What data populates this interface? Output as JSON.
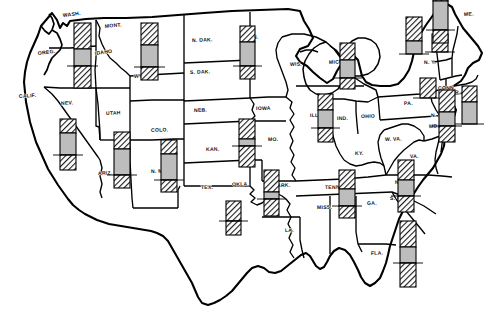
{
  "figure": {
    "type": "choropleth-bar-map",
    "region": "United States (contiguous 48 states)",
    "bar_style": {
      "top_segment": "diagonal-hatch",
      "middle_segment": "light-gray-fill",
      "bottom_segment": "diagonal-hatch",
      "baseline": "horizontal tick line through bar",
      "hatch_color": "#1a1a1a",
      "gray_color": "#bdbdbd",
      "outline_color": "#000000"
    }
  },
  "chart_data": {
    "type": "bar",
    "title": "",
    "xlabel": "",
    "ylabel": "",
    "note": "Each state carries a vertical bar: hatched upper block, light gray middle block crossed by a baseline rule, hatched lower block. Values below are read off the pixel heights of each segment.",
    "categories": [
      "WASH.",
      "OREG.",
      "IDAHO",
      "MONT.",
      "WYO.",
      "N. DAK.",
      "S. DAK.",
      "MINN.",
      "NEB.",
      "KAN.",
      "IOWA",
      "MO.",
      "WIS.",
      "MICH.",
      "ILL.",
      "IND.",
      "OHIO",
      "N.Y.",
      "PA.",
      "MASS.",
      "CONN.",
      "N.J.",
      "DEL.",
      "MD.",
      "VA.",
      "N.C.",
      "S.C.",
      "GA.",
      "FLA.",
      "ALA.",
      "MISS.",
      "TENN.",
      "KY.",
      "ARK.",
      "LA.",
      "OKLA.",
      "TEX.",
      "N. MEX.",
      "ARIZ.",
      "UTAH",
      "NEV.",
      "COLO.",
      "CALIF.",
      "W. VA.",
      "ME.",
      "R.I.",
      "VT.",
      "N.H.",
      "MICH-UP",
      "D.C."
    ],
    "series": [
      {
        "name": "upper hatched segment",
        "values": [
          26,
          0,
          0,
          22,
          0,
          0,
          0,
          16,
          0,
          20,
          0,
          21,
          0,
          17,
          16,
          0,
          0,
          24,
          20,
          18,
          0,
          22,
          0,
          0,
          0,
          20,
          0,
          0,
          26,
          19,
          0,
          0,
          0,
          22,
          0,
          20,
          14,
          17,
          14,
          0,
          0,
          0,
          14,
          0,
          0,
          0,
          0,
          0,
          0,
          0
        ]
      },
      {
        "name": "light gray middle segment",
        "values": [
          17,
          0,
          0,
          22,
          0,
          0,
          0,
          24,
          0,
          7,
          0,
          0,
          0,
          18,
          18,
          0,
          0,
          13,
          0,
          0,
          0,
          14,
          0,
          0,
          0,
          16,
          0,
          0,
          16,
          17,
          0,
          0,
          0,
          7,
          0,
          0,
          26,
          26,
          22,
          0,
          0,
          0,
          29,
          0,
          0,
          0,
          0,
          0,
          0,
          0
        ]
      },
      {
        "name": "lower hatched segment",
        "values": [
          22,
          0,
          0,
          13,
          0,
          0,
          0,
          13,
          0,
          21,
          0,
          0,
          0,
          11,
          14,
          0,
          0,
          0,
          0,
          0,
          0,
          16,
          0,
          0,
          0,
          16,
          0,
          0,
          24,
          12,
          0,
          0,
          0,
          17,
          0,
          14,
          12,
          13,
          15,
          0,
          0,
          0,
          13,
          0,
          0,
          0,
          0,
          0,
          0,
          0
        ]
      }
    ],
    "bars": [
      {
        "state": "WASH.",
        "x": 74,
        "baseline": 66,
        "top_h": 26,
        "gray_h": 17,
        "bottom_h": 22,
        "w": 17
      },
      {
        "state": "MONT.",
        "x": 141,
        "baseline": 67,
        "top_h": 22,
        "gray_h": 22,
        "bottom_h": 13,
        "w": 17
      },
      {
        "state": "MINN.",
        "x": 240,
        "baseline": 66,
        "top_h": 16,
        "gray_h": 24,
        "bottom_h": 13,
        "w": 15
      },
      {
        "state": "KAN.",
        "x": 239,
        "baseline": 146,
        "top_h": 20,
        "gray_h": 7,
        "bottom_h": 21,
        "w": 16
      },
      {
        "state": "MICH.",
        "x": 340,
        "baseline": 78,
        "top_h": 17,
        "gray_h": 18,
        "bottom_h": 11,
        "w": 15
      },
      {
        "state": "ILL.",
        "x": 318,
        "baseline": 128,
        "top_h": 16,
        "gray_h": 18,
        "bottom_h": 14,
        "w": 15
      },
      {
        "state": "N.Y.",
        "x": 406,
        "baseline": 54,
        "top_h": 24,
        "gray_h": 13,
        "bottom_h": 0,
        "w": 16
      },
      {
        "state": "PA.",
        "x": 420,
        "baseline": 98,
        "top_h": 20,
        "gray_h": 0,
        "bottom_h": 0,
        "w": 16
      },
      {
        "state": "MASS.",
        "x": 432,
        "baseline": 52,
        "top_h": 18,
        "gray_h": 0,
        "bottom_h": 0,
        "w": 16
      },
      {
        "state": "N.J.",
        "x": 439,
        "baseline": 126,
        "top_h": 22,
        "gray_h": 14,
        "bottom_h": 16,
        "w": 16
      },
      {
        "state": "MD.",
        "x": 462,
        "baseline": 124,
        "top_h": 16,
        "gray_h": 22,
        "bottom_h": 0,
        "w": 15
      },
      {
        "state": "N.C.",
        "x": 398,
        "baseline": 196,
        "top_h": 20,
        "gray_h": 16,
        "bottom_h": 16,
        "w": 16
      },
      {
        "state": "FLA.",
        "x": 400,
        "baseline": 263,
        "top_h": 26,
        "gray_h": 16,
        "bottom_h": 24,
        "w": 16
      },
      {
        "state": "ALA.",
        "x": 339,
        "baseline": 206,
        "top_h": 19,
        "gray_h": 17,
        "bottom_h": 12,
        "w": 16
      },
      {
        "state": "ARK.",
        "x": 264,
        "baseline": 199,
        "top_h": 22,
        "gray_h": 7,
        "bottom_h": 17,
        "w": 15
      },
      {
        "state": "OKLA.",
        "x": 226,
        "baseline": 221,
        "top_h": 20,
        "gray_h": 0,
        "bottom_h": 14,
        "w": 15
      },
      {
        "state": "TEX.",
        "x": 161,
        "baseline": 180,
        "top_h": 14,
        "gray_h": 26,
        "bottom_h": 12,
        "w": 16
      },
      {
        "state": "N. MEX.",
        "x": 114,
        "baseline": 175,
        "top_h": 17,
        "gray_h": 26,
        "bottom_h": 13,
        "w": 16
      },
      {
        "state": "ARIZ.",
        "x": 60,
        "baseline": 155,
        "top_h": 14,
        "gray_h": 22,
        "bottom_h": 15,
        "w": 16
      },
      {
        "state": "CALIF.",
        "x": 433,
        "baseline": 30,
        "top_h": 14,
        "gray_h": 29,
        "bottom_h": 13,
        "w": 15
      }
    ],
    "legend": [],
    "grid": false
  },
  "map": {
    "labels": [
      {
        "name": "WASH.",
        "text": "WASH.",
        "x": 63,
        "y": 17,
        "rot": -7
      },
      {
        "name": "OREG.",
        "text": "OREG.",
        "x": 38,
        "y": 55,
        "rot": -7
      },
      {
        "name": "IDAHO",
        "text": "IDAHO",
        "x": 95,
        "y": 55,
        "rot": -8
      },
      {
        "name": "MONT.",
        "text": "MONT.",
        "x": 105,
        "y": 28,
        "rot": -6
      },
      {
        "name": "WYO.",
        "text": "WYO.",
        "x": 134,
        "y": 78,
        "rot": -4
      },
      {
        "name": "N. DAK.",
        "text": "N. DAK.",
        "x": 192,
        "y": 42,
        "rot": -2
      },
      {
        "name": "S. DAK.",
        "text": "S. DAK.",
        "x": 190,
        "y": 74,
        "rot": -2
      },
      {
        "name": "MINN.",
        "text": "MINN.",
        "x": 243,
        "y": 39,
        "rot": -2
      },
      {
        "name": "NEB.",
        "text": "NEB.",
        "x": 194,
        "y": 112,
        "rot": -2
      },
      {
        "name": "KAN.",
        "text": "KAN.",
        "x": 206,
        "y": 151,
        "rot": -1
      },
      {
        "name": "IOWA",
        "text": "IOWA",
        "x": 256,
        "y": 110,
        "rot": -1
      },
      {
        "name": "MO.",
        "text": "MO.",
        "x": 268,
        "y": 141,
        "rot": -1
      },
      {
        "name": "WIS.",
        "text": "WIS.",
        "x": 290,
        "y": 66,
        "rot": -2
      },
      {
        "name": "MICH.",
        "text": "MICH.",
        "x": 329,
        "y": 64,
        "rot": -3
      },
      {
        "name": "ILL.",
        "text": "ILL.",
        "x": 310,
        "y": 117,
        "rot": -1
      },
      {
        "name": "IND.",
        "text": "IND.",
        "x": 337,
        "y": 120,
        "rot": -1
      },
      {
        "name": "OHIO",
        "text": "OHIO",
        "x": 361,
        "y": 118,
        "rot": -1
      },
      {
        "name": "KY.",
        "text": "KY.",
        "x": 355,
        "y": 155,
        "rot": -1
      },
      {
        "name": "TENN.",
        "text": "TENN.",
        "x": 325,
        "y": 189,
        "rot": -1
      },
      {
        "name": "MISS.",
        "text": "MISS.",
        "x": 317,
        "y": 209,
        "rot": -1
      },
      {
        "name": "ALA.",
        "text": "ALA.",
        "x": 340,
        "y": 207,
        "rot": -1
      },
      {
        "name": "GA.",
        "text": "GA.",
        "x": 367,
        "y": 205,
        "rot": -2
      },
      {
        "name": "FLA.",
        "text": "FLA.",
        "x": 371,
        "y": 255,
        "rot": -3
      },
      {
        "name": "S. C.",
        "text": "S. C.",
        "x": 390,
        "y": 200,
        "rot": -2
      },
      {
        "name": "N. C.",
        "text": "N. C.",
        "x": 395,
        "y": 184,
        "rot": -3
      },
      {
        "name": "VA.",
        "text": "VA.",
        "x": 410,
        "y": 158,
        "rot": -2
      },
      {
        "name": "W. VA.",
        "text": "W. VA.",
        "x": 385,
        "y": 141,
        "rot": -2
      },
      {
        "name": "PA.",
        "text": "PA.",
        "x": 404,
        "y": 105,
        "rot": -2
      },
      {
        "name": "N. Y.",
        "text": "N. Y.",
        "x": 424,
        "y": 64,
        "rot": -2
      },
      {
        "name": "ME.",
        "text": "ME.",
        "x": 464,
        "y": 16,
        "rot": -3
      },
      {
        "name": "MD.",
        "text": "MD.",
        "x": 429,
        "y": 128,
        "rot": -2
      },
      {
        "name": "N. J.",
        "text": "N. J.",
        "x": 431,
        "y": 117,
        "rot": -2
      },
      {
        "name": "CONN.",
        "text": "CONN.",
        "x": 438,
        "y": 90,
        "rot": -2
      },
      {
        "name": "R. I.",
        "text": "R. I.",
        "x": 455,
        "y": 94,
        "rot": -2
      },
      {
        "name": "ARK.",
        "text": "ARK.",
        "x": 277,
        "y": 187,
        "rot": -1
      },
      {
        "name": "LA.",
        "text": "LA.",
        "x": 285,
        "y": 232,
        "rot": -1
      },
      {
        "name": "OKLA.",
        "text": "OKLA.",
        "x": 232,
        "y": 186,
        "rot": -1
      },
      {
        "name": "TEX.",
        "text": "TEX.",
        "x": 201,
        "y": 189,
        "rot": -1
      },
      {
        "name": "N. MEX.",
        "text": "N. MEX.",
        "x": 151,
        "y": 173,
        "rot": -2
      },
      {
        "name": "ARIZ.",
        "text": "ARIZ.",
        "x": 98,
        "y": 175,
        "rot": -2
      },
      {
        "name": "UTAH",
        "text": "UTAH",
        "x": 106,
        "y": 115,
        "rot": -3
      },
      {
        "name": "COLO.",
        "text": "COLO.",
        "x": 151,
        "y": 132,
        "rot": -2
      },
      {
        "name": "NEV.",
        "text": "NEV.",
        "x": 61,
        "y": 105,
        "rot": -3
      },
      {
        "name": "CALIF.",
        "text": "CALIF.",
        "x": 19,
        "y": 98,
        "rot": -4
      }
    ]
  }
}
